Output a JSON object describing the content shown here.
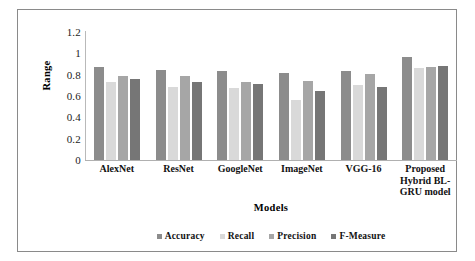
{
  "chart_data": {
    "type": "bar",
    "title": "",
    "xlabel": "Models",
    "ylabel": "Range",
    "ylim": [
      0,
      1.2
    ],
    "yticks": [
      "0",
      "0.2",
      "0.4",
      "0.6",
      "0.8",
      "1",
      "1.2"
    ],
    "ytick_values": [
      0,
      0.2,
      0.4,
      0.6,
      0.8,
      1,
      1.2
    ],
    "grid": false,
    "legend_position": "bottom",
    "categories": [
      "AlexNet",
      "ResNet",
      "GoogleNet",
      "ImageNet",
      "VGG-16",
      "Proposed Hybrid BL-GRU model"
    ],
    "series": [
      {
        "name": "Accuracy",
        "color": "#8c8c8c",
        "values": [
          0.87,
          0.845,
          0.835,
          0.82,
          0.83,
          0.965
        ]
      },
      {
        "name": "Recall",
        "color": "#d9d9d9",
        "values": [
          0.735,
          0.68,
          0.675,
          0.56,
          0.705,
          0.86
        ]
      },
      {
        "name": "Precision",
        "color": "#a6a6a6",
        "values": [
          0.785,
          0.785,
          0.735,
          0.74,
          0.805,
          0.87
        ]
      },
      {
        "name": "F-Measure",
        "color": "#767676",
        "values": [
          0.76,
          0.73,
          0.71,
          0.645,
          0.685,
          0.885
        ]
      }
    ]
  },
  "colors": {
    "accuracy": "#8c8c8c",
    "recall": "#d9d9d9",
    "precision": "#a6a6a6",
    "f_measure": "#767676",
    "axis": "#b0b0b0",
    "frame": "#8a8a8a",
    "text": "#111111",
    "background": "#ffffff"
  }
}
